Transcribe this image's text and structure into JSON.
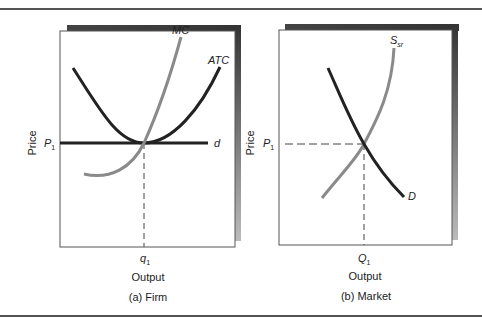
{
  "panels": [
    {
      "id": "a",
      "caption": "(a) Firm",
      "ylabel": "Price",
      "xlabel": "Output",
      "price_tick": {
        "main": "P",
        "sub": "1"
      },
      "qty_tick": {
        "main": "q",
        "sub": "1"
      },
      "curves": [
        {
          "label": "MC",
          "color": "#8a8a8a"
        },
        {
          "label": "ATC",
          "color": "#222222"
        },
        {
          "label": "d",
          "color": "#222222"
        }
      ]
    },
    {
      "id": "b",
      "caption": "(b) Market",
      "ylabel": "Price",
      "xlabel": "Output",
      "price_tick": {
        "main": "P",
        "sub": "1"
      },
      "qty_tick": {
        "main": "Q",
        "sub": "1"
      },
      "curves": [
        {
          "label": "S",
          "sub": "sr",
          "color": "#8a8a8a"
        },
        {
          "label": "D",
          "color": "#222222"
        }
      ]
    }
  ],
  "colors": {
    "frame": "#555555",
    "shadow": "#3a3a3a",
    "dark_curve": "#222222",
    "light_curve": "#8a8a8a"
  }
}
